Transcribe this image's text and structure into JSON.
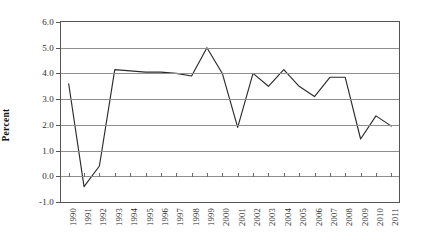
{
  "chart_data": {
    "type": "line",
    "title": "",
    "xlabel": "",
    "ylabel": "Percent",
    "ylim": [
      -1.0,
      6.0
    ],
    "ytick_step": 1.0,
    "yticks": [
      "6.0",
      "5.0",
      "4.0",
      "3.0",
      "2.0",
      "1.0",
      "0.0",
      "-1.0"
    ],
    "ytick_values": [
      6.0,
      5.0,
      4.0,
      3.0,
      2.0,
      1.0,
      0.0,
      -1.0
    ],
    "grid": "horizontal",
    "legend": "none",
    "categories": [
      "1990",
      "1991",
      "1992",
      "1993",
      "1994",
      "1995",
      "1996",
      "1997",
      "1998",
      "1999",
      "2000",
      "2001",
      "2002",
      "2003",
      "2004",
      "2005",
      "2006",
      "2007",
      "2008",
      "2009",
      "2010",
      "2011"
    ],
    "values": [
      3.6,
      -0.4,
      0.4,
      4.15,
      4.1,
      4.05,
      4.05,
      4.0,
      3.9,
      5.0,
      4.0,
      1.9,
      4.0,
      3.5,
      4.15,
      3.5,
      3.1,
      3.85,
      3.85,
      1.45,
      2.35,
      1.95
    ],
    "series": [
      {
        "name": "Percent",
        "color": "#2b2b2b",
        "values": [
          3.6,
          -0.4,
          0.4,
          4.15,
          4.1,
          4.05,
          4.05,
          4.0,
          3.9,
          5.0,
          4.0,
          1.9,
          4.0,
          3.5,
          4.15,
          3.5,
          3.1,
          3.85,
          3.85,
          1.45,
          2.35,
          1.95
        ]
      }
    ],
    "colors": {
      "line": "#2b2b2b",
      "grid": "#8e8e8e",
      "axis": "#555555",
      "background": "#ffffff",
      "text": "#1a1a1a"
    }
  }
}
